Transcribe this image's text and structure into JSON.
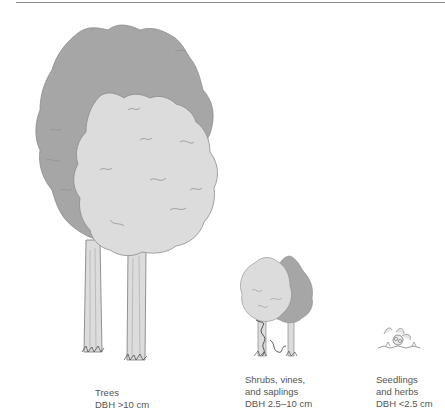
{
  "figure": {
    "colors": {
      "dark_canopy": "#a6a6a6",
      "light_canopy": "#dcdcdc",
      "outline": "#7a7a7a",
      "trunk": "#d9d9d9",
      "caption_text": "#555555",
      "rule": "#8a8a8a"
    },
    "groups": [
      {
        "name": "trees",
        "lines": [
          "Trees",
          "DBH >10 cm"
        ]
      },
      {
        "name": "shrubs-vines-saplings",
        "lines": [
          "Shrubs, vines,",
          "and saplings",
          "DBH 2.5–10 cm"
        ]
      },
      {
        "name": "seedlings-herbs",
        "lines": [
          "Seedlings",
          "and herbs",
          "DBH <2.5 cm"
        ]
      }
    ]
  }
}
